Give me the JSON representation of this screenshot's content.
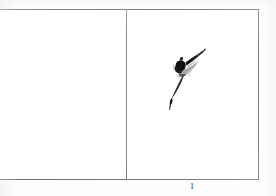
{
  "page": {
    "type": "scanned-book-page",
    "background_color": "#ffffff",
    "ink_color": "#111111",
    "rule_color": "#8a8a8a"
  },
  "plate": {
    "panels": [
      {
        "id": "left",
        "name": "blank-verso-panel",
        "content": "",
        "has_artwork": false
      },
      {
        "id": "right",
        "name": "illustration-panel",
        "content": "",
        "has_artwork": true,
        "artwork": {
          "name": "ink-brush-figure",
          "description": "loose sumi-e style brush sketch of a leaping dancer figure",
          "medium": "ink wash"
        }
      }
    ]
  },
  "caption": {
    "label": "1"
  }
}
